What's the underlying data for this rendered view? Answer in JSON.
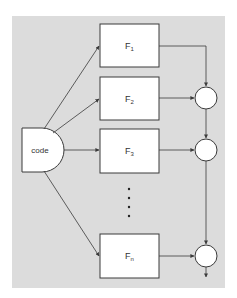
{
  "diagram": {
    "background_color": "#dcdcdc",
    "line_color": "#3a3a3a",
    "source": {
      "label": "code"
    },
    "functions": [
      {
        "base": "F",
        "sub": "1"
      },
      {
        "base": "F",
        "sub": "2"
      },
      {
        "base": "F",
        "sub": "3"
      },
      {
        "base": "F",
        "sub": "n"
      }
    ],
    "ellipsis": "⋮",
    "combiners": 3
  }
}
